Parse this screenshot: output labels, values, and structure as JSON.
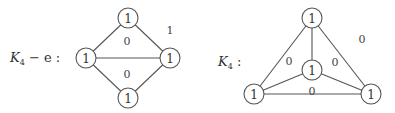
{
  "graphs": [
    {
      "name": "K4 minus e",
      "label": {
        "main": "K",
        "sub": "4",
        "suffix": " − e :"
      },
      "nodes": [
        {
          "id": "top",
          "x": 128,
          "y": 18,
          "label": "1"
        },
        {
          "id": "left",
          "x": 86,
          "y": 58,
          "label": "1"
        },
        {
          "id": "right",
          "x": 170,
          "y": 58,
          "label": "1"
        },
        {
          "id": "bottom",
          "x": 128,
          "y": 98,
          "label": "1"
        }
      ],
      "edges": [
        [
          "top",
          "left"
        ],
        [
          "top",
          "right"
        ],
        [
          "left",
          "right"
        ],
        [
          "left",
          "bottom"
        ],
        [
          "right",
          "bottom"
        ]
      ],
      "face_labels": [
        {
          "x": 170,
          "y": 30,
          "label": "1"
        },
        {
          "x": 127,
          "y": 41,
          "label": "0"
        },
        {
          "x": 127,
          "y": 74,
          "label": "0"
        }
      ]
    },
    {
      "name": "K4",
      "label": {
        "main": "K",
        "sub": "4",
        "suffix": " :"
      },
      "nodes": [
        {
          "id": "top",
          "x": 312,
          "y": 18,
          "label": "1"
        },
        {
          "id": "center",
          "x": 312,
          "y": 70,
          "label": "1"
        },
        {
          "id": "bl",
          "x": 254,
          "y": 94,
          "label": "1"
        },
        {
          "id": "br",
          "x": 371,
          "y": 94,
          "label": "1"
        }
      ],
      "edges": [
        [
          "top",
          "center"
        ],
        [
          "top",
          "bl"
        ],
        [
          "top",
          "br"
        ],
        [
          "center",
          "bl"
        ],
        [
          "center",
          "br"
        ],
        [
          "bl",
          "br"
        ]
      ],
      "face_labels": [
        {
          "x": 362,
          "y": 39,
          "label": "0"
        },
        {
          "x": 289,
          "y": 61,
          "label": "0"
        },
        {
          "x": 335,
          "y": 62,
          "label": "0"
        },
        {
          "x": 312,
          "y": 91,
          "label": "0"
        }
      ]
    }
  ],
  "labels": {
    "left_title_main": "K",
    "left_title_sub": "4",
    "left_title_suffix": " − e :",
    "right_title_main": "K",
    "right_title_sub": "4",
    "right_title_suffix": " :"
  }
}
